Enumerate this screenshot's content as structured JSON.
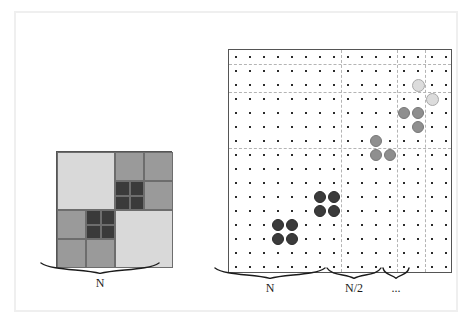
{
  "figure": {
    "kind": "diagram",
    "colors": {
      "frame": "#efefef",
      "outline": "#555555",
      "light_fill": "#d9d9d9",
      "mid_fill": "#9a9a9a",
      "dark_fill": "#3a3a3a",
      "dot": "#2b2b2b",
      "dash": "#b4b4b4",
      "circle_dark": "#3b3b3b",
      "circle_mid": "#8f8f8f",
      "circle_light": "#dcdcdc"
    }
  },
  "left_panel": {
    "label": "N",
    "size_px": 116,
    "cells": [
      {
        "id": "q-top-left",
        "x": 0,
        "y": 0,
        "w": 58,
        "h": 58,
        "shade": "light"
      },
      {
        "id": "q-tr-top-left",
        "x": 58,
        "y": 0,
        "w": 29,
        "h": 29,
        "shade": "mid"
      },
      {
        "id": "q-tr-top-right",
        "x": 87,
        "y": 0,
        "w": 29,
        "h": 29,
        "shade": "mid"
      },
      {
        "id": "q-tr-bot-right",
        "x": 87,
        "y": 29,
        "w": 29,
        "h": 29,
        "shade": "mid"
      },
      {
        "id": "q-tr-bl-a",
        "x": 58,
        "y": 29,
        "w": 15,
        "h": 15,
        "shade": "dark"
      },
      {
        "id": "q-tr-bl-b",
        "x": 73,
        "y": 29,
        "w": 14,
        "h": 15,
        "shade": "dark"
      },
      {
        "id": "q-tr-bl-c",
        "x": 58,
        "y": 44,
        "w": 15,
        "h": 14,
        "shade": "dark"
      },
      {
        "id": "q-tr-bl-d",
        "x": 73,
        "y": 44,
        "w": 14,
        "h": 14,
        "shade": "dark"
      },
      {
        "id": "q-bl-top-left",
        "x": 0,
        "y": 58,
        "w": 29,
        "h": 29,
        "shade": "mid"
      },
      {
        "id": "q-bl-bot-left",
        "x": 0,
        "y": 87,
        "w": 29,
        "h": 29,
        "shade": "mid"
      },
      {
        "id": "q-bl-bot-right",
        "x": 29,
        "y": 87,
        "w": 29,
        "h": 29,
        "shade": "mid"
      },
      {
        "id": "q-bl-tr-a",
        "x": 29,
        "y": 58,
        "w": 15,
        "h": 15,
        "shade": "dark"
      },
      {
        "id": "q-bl-tr-b",
        "x": 44,
        "y": 58,
        "w": 14,
        "h": 15,
        "shade": "dark"
      },
      {
        "id": "q-bl-tr-c",
        "x": 29,
        "y": 73,
        "w": 15,
        "h": 14,
        "shade": "dark"
      },
      {
        "id": "q-bl-tr-d",
        "x": 44,
        "y": 73,
        "w": 14,
        "h": 14,
        "shade": "dark"
      },
      {
        "id": "q-bottom-right",
        "x": 58,
        "y": 58,
        "w": 58,
        "h": 58,
        "shade": "light"
      }
    ]
  },
  "right_panel": {
    "grid": {
      "cols": 16,
      "rows": 16,
      "size_px": 224,
      "step_px": 14,
      "origin_px": 7
    },
    "dashed_vertical_after_col": [
      8,
      12,
      14
    ],
    "dashed_horizontal_after_row": [
      1,
      3,
      7
    ],
    "circles": [
      {
        "col": 13,
        "row": 2,
        "shade": "light",
        "d": 13
      },
      {
        "col": 14,
        "row": 3,
        "shade": "light",
        "d": 13
      },
      {
        "col": 12,
        "row": 4,
        "shade": "mid",
        "d": 12
      },
      {
        "col": 13,
        "row": 4,
        "shade": "mid",
        "d": 12
      },
      {
        "col": 13,
        "row": 5,
        "shade": "mid",
        "d": 12
      },
      {
        "col": 10,
        "row": 6,
        "shade": "mid",
        "d": 12
      },
      {
        "col": 10,
        "row": 7,
        "shade": "mid",
        "d": 12
      },
      {
        "col": 11,
        "row": 7,
        "shade": "mid",
        "d": 12
      },
      {
        "col": 6,
        "row": 10,
        "shade": "dark",
        "d": 12
      },
      {
        "col": 7,
        "row": 10,
        "shade": "dark",
        "d": 12
      },
      {
        "col": 6,
        "row": 11,
        "shade": "dark",
        "d": 12
      },
      {
        "col": 7,
        "row": 11,
        "shade": "dark",
        "d": 12
      },
      {
        "col": 3,
        "row": 12,
        "shade": "dark",
        "d": 12
      },
      {
        "col": 4,
        "row": 12,
        "shade": "dark",
        "d": 12
      },
      {
        "col": 3,
        "row": 13,
        "shade": "dark",
        "d": 12
      },
      {
        "col": 4,
        "row": 13,
        "shade": "dark",
        "d": 12
      }
    ],
    "braces": [
      {
        "id": "brace-n",
        "label": "N",
        "x": 0,
        "w": 112
      },
      {
        "id": "brace-n-half",
        "label": "N/2",
        "x": 112,
        "w": 56
      },
      {
        "id": "brace-ellip",
        "label": "...",
        "x": 168,
        "w": 28
      }
    ]
  }
}
